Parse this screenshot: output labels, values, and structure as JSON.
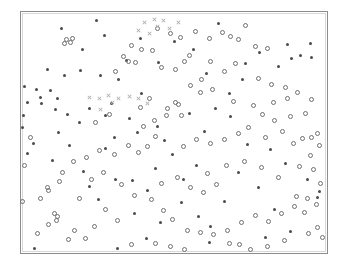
{
  "figure": {
    "title": "",
    "background_color": "#ffffff",
    "frame_color": "#8c8c8c"
  },
  "chart_data": {
    "type": "scatter",
    "title": "",
    "subtitle": "",
    "xlabel": "",
    "ylabel": "",
    "xlim": [
      0,
      100
    ],
    "ylim": [
      0,
      100
    ],
    "grid": false,
    "legend_position": "none",
    "axis_ticks": {
      "x": [],
      "y": []
    },
    "colors": {
      "filled_marker": "#4a4a4a",
      "open_marker": "#6f6f6f",
      "cross_marker": "#b0b0b0"
    },
    "series": [
      {
        "name": "filled-dot",
        "marker": "filled-circle",
        "color": "#4a4a4a",
        "points": [
          [
            13.1,
            93.2
          ],
          [
            24.6,
            96.5
          ],
          [
            27.3,
            90.3
          ],
          [
            38.9,
            89.0
          ],
          [
            64.5,
            95.1
          ],
          [
            50.0,
            87.7
          ],
          [
            8.8,
            76.2
          ],
          [
            14.2,
            73.5
          ],
          [
            19.5,
            75.8
          ],
          [
            26.0,
            73.5
          ],
          [
            31.8,
            72.0
          ],
          [
            1.2,
            69.0
          ],
          [
            5.1,
            68.0
          ],
          [
            9.6,
            67.5
          ],
          [
            6.3,
            64.5
          ],
          [
            12.0,
            64.0
          ],
          [
            2.0,
            62.4
          ],
          [
            6.8,
            62.0
          ],
          [
            11.4,
            59.5
          ],
          [
            15.1,
            57.6
          ],
          [
            22.4,
            60.0
          ],
          [
            27.6,
            57.0
          ],
          [
            19.0,
            54.0
          ],
          [
            12.4,
            50.0
          ],
          [
            30.5,
            48.0
          ],
          [
            38.0,
            49.8
          ],
          [
            44.6,
            52.5
          ],
          [
            27.6,
            43.5
          ],
          [
            16.0,
            44.5
          ],
          [
            4.1,
            45.6
          ],
          [
            2.2,
            41.3
          ],
          [
            10.2,
            38.5
          ],
          [
            20.5,
            34.0
          ],
          [
            30.8,
            30.6
          ],
          [
            41.5,
            26.0
          ],
          [
            25.2,
            22.0
          ],
          [
            37.0,
            16.5
          ],
          [
            52.3,
            20.8
          ],
          [
            45.5,
            12.5
          ],
          [
            58.0,
            15.2
          ],
          [
            62.0,
            11.0
          ],
          [
            53.0,
            30.5
          ],
          [
            57.5,
            36.5
          ],
          [
            49.5,
            41.0
          ],
          [
            47.0,
            46.5
          ],
          [
            60.0,
            50.5
          ],
          [
            63.5,
            60.0
          ],
          [
            68.0,
            66.0
          ],
          [
            73.5,
            78.5
          ],
          [
            78.0,
            83.0
          ],
          [
            84.0,
            77.5
          ],
          [
            88.5,
            80.5
          ],
          [
            91.5,
            82.0
          ],
          [
            95.0,
            81.0
          ],
          [
            87.0,
            86.5
          ],
          [
            94.5,
            87.0
          ],
          [
            72.5,
            72.0
          ],
          [
            68.5,
            56.5
          ],
          [
            74.0,
            45.0
          ],
          [
            81.5,
            43.0
          ],
          [
            86.5,
            37.0
          ],
          [
            93.5,
            30.5
          ],
          [
            97.5,
            25.5
          ],
          [
            97.0,
            23.0
          ],
          [
            77.5,
            27.0
          ],
          [
            71.0,
            33.5
          ],
          [
            83.0,
            18.0
          ],
          [
            88.0,
            9.0
          ],
          [
            66.5,
            21.5
          ],
          [
            61.5,
            4.5
          ],
          [
            80.0,
            6.5
          ],
          [
            41.0,
            6.0
          ],
          [
            4.5,
            2.0
          ],
          [
            31.5,
            2.0
          ],
          [
            36.5,
            30.0
          ],
          [
            22.5,
            27.5
          ],
          [
            44.0,
            35.0
          ],
          [
            55.0,
            58.0
          ],
          [
            39.5,
            66.0
          ],
          [
            34.5,
            80.0
          ],
          [
            60.5,
            74.5
          ],
          [
            56.5,
            84.5
          ],
          [
            45.0,
            79.0
          ],
          [
            20.0,
            84.5
          ],
          [
            29.5,
            62.0
          ],
          [
            35.5,
            56.0
          ],
          [
            0.5,
            52.0
          ],
          [
            0.8,
            57.0
          ]
        ]
      },
      {
        "name": "open-circle",
        "marker": "open-circle",
        "color": "#6f6f6f",
        "points": [
          [
            15.0,
            88.5
          ],
          [
            16.8,
            89.2
          ],
          [
            16.2,
            87.4
          ],
          [
            14.3,
            87.0
          ],
          [
            44.5,
            93.0
          ],
          [
            48.8,
            91.0
          ],
          [
            52.0,
            89.5
          ],
          [
            57.0,
            92.0
          ],
          [
            61.5,
            89.0
          ],
          [
            66.0,
            91.5
          ],
          [
            68.5,
            90.0
          ],
          [
            73.5,
            94.5
          ],
          [
            71.0,
            88.5
          ],
          [
            76.5,
            85.5
          ],
          [
            80.5,
            85.0
          ],
          [
            36.0,
            86.0
          ],
          [
            39.5,
            84.5
          ],
          [
            43.0,
            84.0
          ],
          [
            33.5,
            81.5
          ],
          [
            35.0,
            79.5
          ],
          [
            37.5,
            79.0
          ],
          [
            31.0,
            75.5
          ],
          [
            46.0,
            77.0
          ],
          [
            50.5,
            76.0
          ],
          [
            53.5,
            79.5
          ],
          [
            55.0,
            82.0
          ],
          [
            62.0,
            79.5
          ],
          [
            66.5,
            75.5
          ],
          [
            70.0,
            78.5
          ],
          [
            77.5,
            72.5
          ],
          [
            82.0,
            70.0
          ],
          [
            86.5,
            68.5
          ],
          [
            59.0,
            72.0
          ],
          [
            55.5,
            69.5
          ],
          [
            58.5,
            66.5
          ],
          [
            62.5,
            68.0
          ],
          [
            69.5,
            63.0
          ],
          [
            76.0,
            61.0
          ],
          [
            82.5,
            62.5
          ],
          [
            87.0,
            64.0
          ],
          [
            90.5,
            66.5
          ],
          [
            95.0,
            63.5
          ],
          [
            93.0,
            58.0
          ],
          [
            88.0,
            56.5
          ],
          [
            83.0,
            55.0
          ],
          [
            79.0,
            57.5
          ],
          [
            74.5,
            52.0
          ],
          [
            71.0,
            49.5
          ],
          [
            66.5,
            47.0
          ],
          [
            62.0,
            45.5
          ],
          [
            57.5,
            47.0
          ],
          [
            53.0,
            44.0
          ],
          [
            48.0,
            60.0
          ],
          [
            50.5,
            62.5
          ],
          [
            51.5,
            61.5
          ],
          [
            47.5,
            57.0
          ],
          [
            52.5,
            57.0
          ],
          [
            43.5,
            55.0
          ],
          [
            40.0,
            52.5
          ],
          [
            44.0,
            48.5
          ],
          [
            41.5,
            44.0
          ],
          [
            38.5,
            41.5
          ],
          [
            35.0,
            44.5
          ],
          [
            30.5,
            41.0
          ],
          [
            25.5,
            42.5
          ],
          [
            21.5,
            39.5
          ],
          [
            17.0,
            38.0
          ],
          [
            13.5,
            33.5
          ],
          [
            12.5,
            29.5
          ],
          [
            8.5,
            27.0
          ],
          [
            9.0,
            26.0
          ],
          [
            6.5,
            22.5
          ],
          [
            11.0,
            16.5
          ],
          [
            12.0,
            15.0
          ],
          [
            11.5,
            13.5
          ],
          [
            9.0,
            12.0
          ],
          [
            19.0,
            22.5
          ],
          [
            23.0,
            30.5
          ],
          [
            27.0,
            33.5
          ],
          [
            33.0,
            28.5
          ],
          [
            37.0,
            24.0
          ],
          [
            42.5,
            22.0
          ],
          [
            46.5,
            17.5
          ],
          [
            49.5,
            14.0
          ],
          [
            54.5,
            9.5
          ],
          [
            58.5,
            8.5
          ],
          [
            63.0,
            7.5
          ],
          [
            67.5,
            9.5
          ],
          [
            72.0,
            12.5
          ],
          [
            76.5,
            15.5
          ],
          [
            81.0,
            13.0
          ],
          [
            85.0,
            16.5
          ],
          [
            89.5,
            19.5
          ],
          [
            92.5,
            17.0
          ],
          [
            96.5,
            20.0
          ],
          [
            98.0,
            29.0
          ],
          [
            95.5,
            34.5
          ],
          [
            91.0,
            36.0
          ],
          [
            94.5,
            40.5
          ],
          [
            97.5,
            44.5
          ],
          [
            89.0,
            45.5
          ],
          [
            92.0,
            47.5
          ],
          [
            95.0,
            48.0
          ],
          [
            97.0,
            49.5
          ],
          [
            85.5,
            50.5
          ],
          [
            80.0,
            48.0
          ],
          [
            93.5,
            22.5
          ],
          [
            90.0,
            23.5
          ],
          [
            97.0,
            10.5
          ],
          [
            94.0,
            8.0
          ],
          [
            98.5,
            6.5
          ],
          [
            68.0,
            4.0
          ],
          [
            71.5,
            3.5
          ],
          [
            49.0,
            2.5
          ],
          [
            53.5,
            1.5
          ],
          [
            44.0,
            4.0
          ],
          [
            36.0,
            3.5
          ],
          [
            15.5,
            5.5
          ],
          [
            21.0,
            6.0
          ],
          [
            5.5,
            8.0
          ],
          [
            0.5,
            21.5
          ],
          [
            1.0,
            36.5
          ],
          [
            3.0,
            48.0
          ],
          [
            84.0,
            31.5
          ],
          [
            78.5,
            35.5
          ],
          [
            73.0,
            38.0
          ],
          [
            67.0,
            36.5
          ],
          [
            61.0,
            33.0
          ],
          [
            64.0,
            28.5
          ],
          [
            59.5,
            25.0
          ],
          [
            55.5,
            27.0
          ],
          [
            51.0,
            31.5
          ],
          [
            46.0,
            29.0
          ],
          [
            27.5,
            18.0
          ],
          [
            31.5,
            13.5
          ],
          [
            24.0,
            11.0
          ],
          [
            17.5,
            9.5
          ],
          [
            86.0,
            5.0
          ],
          [
            80.5,
            2.5
          ],
          [
            75.0,
            1.5
          ],
          [
            39.0,
            60.5
          ],
          [
            42.0,
            64.0
          ],
          [
            29.0,
            57.5
          ],
          [
            24.5,
            54.0
          ]
        ]
      },
      {
        "name": "gray-cross",
        "marker": "x",
        "color": "#b0b0b0",
        "points": [
          [
            40.5,
            95.5
          ],
          [
            43.5,
            97.0
          ],
          [
            44.5,
            94.0
          ],
          [
            46.5,
            96.5
          ],
          [
            48.5,
            93.0
          ],
          [
            51.5,
            95.5
          ],
          [
            38.5,
            92.5
          ],
          [
            42.0,
            91.0
          ],
          [
            22.5,
            64.5
          ],
          [
            25.5,
            64.0
          ],
          [
            28.5,
            65.5
          ],
          [
            32.0,
            64.0
          ],
          [
            35.5,
            65.0
          ],
          [
            38.5,
            64.0
          ],
          [
            30.0,
            62.5
          ],
          [
            26.0,
            59.5
          ],
          [
            41.5,
            62.0
          ]
        ]
      }
    ]
  }
}
